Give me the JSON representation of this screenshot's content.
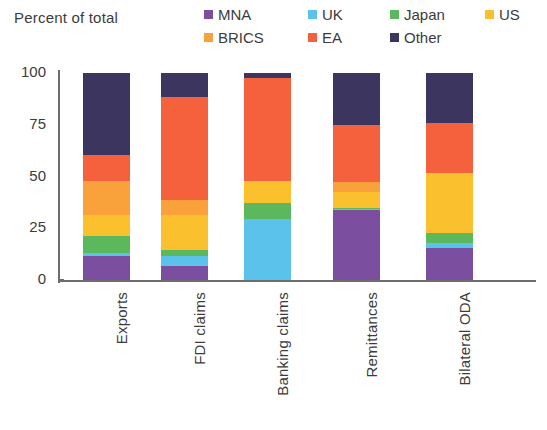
{
  "chart_data": {
    "type": "bar",
    "stacked": true,
    "title": "",
    "ylabel": "Percent of total",
    "xlabel": "",
    "ylim": [
      0,
      100
    ],
    "yticks": [
      0,
      25,
      50,
      75,
      100
    ],
    "ytick_labels": [
      "0",
      "25",
      "50",
      "75",
      "100"
    ],
    "grid": false,
    "legend_position": "top-right",
    "categories": [
      "Exports",
      "FDI claims",
      "Banking claims",
      "Remittances",
      "Bilateral ODA"
    ],
    "series": [
      {
        "name": "MNA",
        "color": "#7b4ea0",
        "values": [
          11.5,
          7.0,
          0.0,
          34.0,
          15.5
        ]
      },
      {
        "name": "UK",
        "color": "#5bc2ec",
        "values": [
          1.5,
          4.5,
          29.5,
          0.5,
          2.5
        ]
      },
      {
        "name": "Japan",
        "color": "#5cb85c",
        "values": [
          8.5,
          3.0,
          7.5,
          0.5,
          4.5
        ]
      },
      {
        "name": "US",
        "color": "#fbc02d",
        "values": [
          10.0,
          17.0,
          11.0,
          7.5,
          29.0
        ]
      },
      {
        "name": "BRICS",
        "color": "#f9a13a",
        "values": [
          16.5,
          7.0,
          0.0,
          5.0,
          0.0
        ]
      },
      {
        "name": "EA",
        "color": "#f4613c",
        "values": [
          12.5,
          50.0,
          49.5,
          27.5,
          24.5
        ]
      },
      {
        "name": "Other",
        "color": "#3b3560",
        "values": [
          39.5,
          11.5,
          2.5,
          25.0,
          24.0
        ]
      }
    ]
  },
  "legend": {
    "items": [
      {
        "label": "MNA",
        "color": "#7b4ea0"
      },
      {
        "label": "UK",
        "color": "#5bc2ec"
      },
      {
        "label": "Japan",
        "color": "#5cb85c"
      },
      {
        "label": "US",
        "color": "#fbc02d"
      },
      {
        "label": "BRICS",
        "color": "#f9a13a"
      },
      {
        "label": "EA",
        "color": "#f4613c"
      },
      {
        "label": "Other",
        "color": "#3b3560"
      }
    ]
  },
  "axis": {
    "y_title": "Percent of total"
  }
}
